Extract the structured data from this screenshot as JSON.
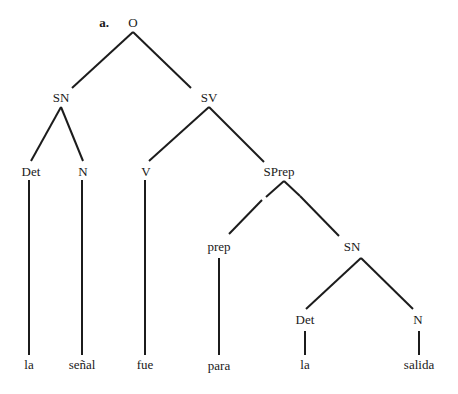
{
  "diagram": {
    "type": "syntax-tree",
    "example_label": "a.",
    "nodes": {
      "root": {
        "label": "O"
      },
      "sn1": {
        "label": "SN"
      },
      "sv": {
        "label": "SV"
      },
      "det1": {
        "label": "Det"
      },
      "n1": {
        "label": "N"
      },
      "v": {
        "label": "V"
      },
      "sprep": {
        "label": "SPrep"
      },
      "prep": {
        "label": "prep"
      },
      "sn2": {
        "label": "SN"
      },
      "det2": {
        "label": "Det"
      },
      "n2": {
        "label": "N"
      }
    },
    "leaves": {
      "la1": "la",
      "senal": "señal",
      "fue": "fue",
      "para": "para",
      "la2": "la",
      "salida": "salida"
    },
    "edges": [
      [
        "root",
        "sn1"
      ],
      [
        "root",
        "sv"
      ],
      [
        "sn1",
        "det1"
      ],
      [
        "sn1",
        "n1"
      ],
      [
        "sv",
        "v"
      ],
      [
        "sv",
        "sprep"
      ],
      [
        "det1",
        "la1"
      ],
      [
        "n1",
        "senal"
      ],
      [
        "v",
        "fue"
      ],
      [
        "sprep",
        "prep"
      ],
      [
        "sprep",
        "sn2"
      ],
      [
        "prep",
        "para"
      ],
      [
        "sn2",
        "det2"
      ],
      [
        "sn2",
        "n2"
      ],
      [
        "det2",
        "la2"
      ],
      [
        "n2",
        "salida"
      ]
    ]
  }
}
